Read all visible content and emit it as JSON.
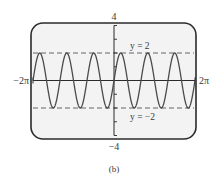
{
  "chart_data": {
    "type": "line",
    "title": "",
    "caption": "(b)",
    "xlabel": "",
    "ylabel": "",
    "xlim": [
      -6.283185307,
      6.283185307
    ],
    "ylim": [
      -4,
      4
    ],
    "x_tick_labels": {
      "min": "−2π",
      "max": "2π"
    },
    "y_tick_labels": {
      "max": "4",
      "min": "−4"
    },
    "y_ticks": [
      -4,
      -3,
      -2,
      -1,
      0,
      1,
      2,
      3,
      4
    ],
    "grid": false,
    "series": [
      {
        "name": "y = 2 sin(3x)",
        "function": "2*sin(3*x)",
        "amplitude": 2,
        "frequency": 3,
        "periods_shown": 6,
        "style": "solid"
      }
    ],
    "reference_lines": [
      {
        "label": "y = 2",
        "y": 2,
        "style": "dashed"
      },
      {
        "label": "y = −2",
        "y": -2,
        "style": "dashed"
      }
    ],
    "colors": {
      "curve": "#4a4a4a",
      "frame": "#2b2b2b",
      "screen": "#f3f3f3",
      "dashed": "#555555",
      "text": "#3a3a3a"
    }
  }
}
